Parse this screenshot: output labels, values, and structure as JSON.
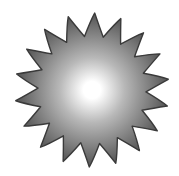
{
  "image": {
    "width": 179,
    "height": 176,
    "background": "#ffffff"
  },
  "sun_icon": {
    "icon": "sun-icon",
    "description": "Grayscale sunburst with radial gradient",
    "center": [
      92,
      90
    ],
    "ray_count": 18,
    "outer_radius": 77,
    "inner_radius": 54,
    "rotation_deg": -88,
    "ray_curl": 0.18,
    "colors": {
      "center": "#ffffff",
      "mid": "#b8b8b8",
      "edge": "#5e5e5e",
      "outline": "#3a3a3a"
    }
  }
}
